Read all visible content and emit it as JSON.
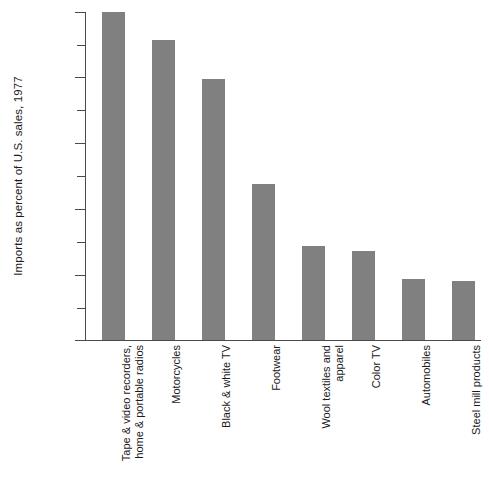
{
  "chart_data": {
    "type": "bar",
    "title": "",
    "subtitle": "",
    "xlabel": "",
    "ylabel": "Imports as percent of U.S. sales, 1977",
    "ylim": [
      0,
      100
    ],
    "grid": false,
    "legend": null,
    "orientation": "vertical",
    "bar_color": "#808080",
    "axis_color": "#4a4a4a",
    "categories": [
      "Tape & video recorders,\nhome & portable radios",
      "Motorcycles",
      "Black & white TV",
      "Footwear",
      "Wool textiles and\napparel",
      "Color TV",
      "Automobiles",
      "Steel mill products"
    ],
    "values": [
      100,
      91.5,
      79.6,
      47.5,
      28.7,
      27.1,
      18.6,
      17.9
    ],
    "y_major_ticks": [
      0,
      20,
      40,
      60,
      80,
      100
    ],
    "y_minor_ticks": [
      10,
      30,
      50,
      70,
      90
    ],
    "y_tick_labels": [
      "0",
      "20",
      "40",
      "60",
      "80",
      "100%"
    ]
  },
  "axis": {
    "y_title": "Imports as percent of U.S. sales, 1977",
    "tick_labels": {
      "t0": "0",
      "t20": "20",
      "t40": "40",
      "t60": "60",
      "t80": "80",
      "t100": "100%"
    }
  },
  "bars": [
    {
      "label": "Tape & video recorders, home & portable radios",
      "line1": "Tape & video recorders,",
      "line2": "home & portable radios",
      "value": 100
    },
    {
      "label": "Motorcycles",
      "line1": "Motorcycles",
      "line2": "",
      "value": 91.5
    },
    {
      "label": "Black & white TV",
      "line1": "Black & white TV",
      "line2": "",
      "value": 79.6
    },
    {
      "label": "Footwear",
      "line1": "Footwear",
      "line2": "",
      "value": 47.5
    },
    {
      "label": "Wool textiles and apparel",
      "line1": "Wool textiles and",
      "line2": "apparel",
      "value": 28.7
    },
    {
      "label": "Color TV",
      "line1": "Color TV",
      "line2": "",
      "value": 27.1
    },
    {
      "label": "Automobiles",
      "line1": "Automobiles",
      "line2": "",
      "value": 18.6
    },
    {
      "label": "Steel mill products",
      "line1": "Steel mill products",
      "line2": "",
      "value": 17.9
    }
  ],
  "footer": {
    "source_note": ""
  }
}
